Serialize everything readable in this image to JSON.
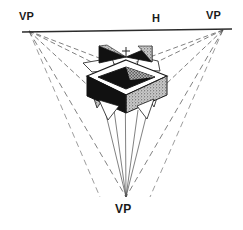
{
  "diagram": {
    "type": "three-point-perspective-construction",
    "background_color": "#ffffff",
    "ink_color": "#1a1a1a",
    "labels": {
      "vp_left": "VP",
      "vp_right": "VP",
      "vp_bottom": "VP",
      "horizon": "H"
    },
    "vanishing_points": [
      {
        "name": "vp-left",
        "label": "VP",
        "x": 29,
        "y": 31
      },
      {
        "name": "vp-right",
        "label": "VP",
        "x": 223,
        "y": 30
      },
      {
        "name": "vp-bottom",
        "label": "VP",
        "x": 126,
        "y": 197
      }
    ],
    "horizon_line": {
      "label": "H",
      "x1": 22,
      "y1": 32,
      "x2": 232,
      "y2": 29,
      "style": "solid"
    },
    "construction_lines_style": "dashed",
    "object": {
      "name": "open-top-box",
      "description": "Cube with hollow square opening on top, dark left face, stippled right face, triangular wing flaps",
      "faces": {
        "top_rim": "#ffffff",
        "interior": "#6b6b6b",
        "left_face": "#141414",
        "right_face": "#8f8f8f",
        "wing_light": "#9a9a9a",
        "wing_dark": "#141414"
      },
      "center_mark": "+"
    },
    "colors": {
      "ink": "#1a1a1a",
      "dashed": "#4a4a4a",
      "horizon": "#2b2b2b",
      "fill_dark": "#111111",
      "fill_mid": "#8d8d8d",
      "fill_light": "#ffffff"
    }
  }
}
